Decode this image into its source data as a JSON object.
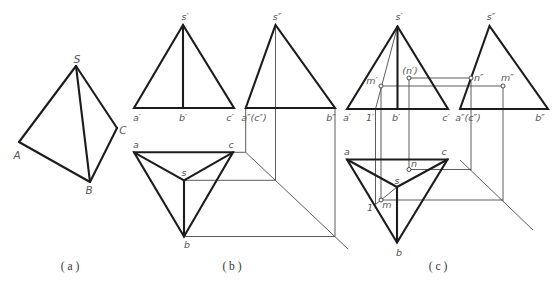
{
  "figure": {
    "panel_a": {
      "caption": "( a )",
      "labels": {
        "S": "S",
        "A": "A",
        "B": "B",
        "C": "C"
      }
    },
    "panel_b": {
      "caption": "( b )",
      "front_view": {
        "s": "s′",
        "a": "a′",
        "b": "b′",
        "c": "c′"
      },
      "side_view": {
        "s": "s″",
        "ac": "a″(c″)",
        "b": "b″"
      },
      "top_view": {
        "a": "a",
        "c": "c",
        "s": "s",
        "b": "b"
      }
    },
    "panel_c": {
      "caption": "( c )",
      "front_view": {
        "s": "s′",
        "a": "a′",
        "one": "1′",
        "b": "b′",
        "c": "c′",
        "m": "m′",
        "n": "(n′)"
      },
      "side_view": {
        "s": "s″",
        "ac": "a″(c″)",
        "b": "b″",
        "n": "n″",
        "m": "m″"
      },
      "top_view": {
        "a": "a",
        "c": "c",
        "n": "n",
        "s": "s",
        "m": "m",
        "one": "1",
        "b": "b"
      }
    },
    "colors": {
      "line": "#1c1c1c",
      "construction": "#4a4a4a",
      "label": "#555555"
    }
  }
}
